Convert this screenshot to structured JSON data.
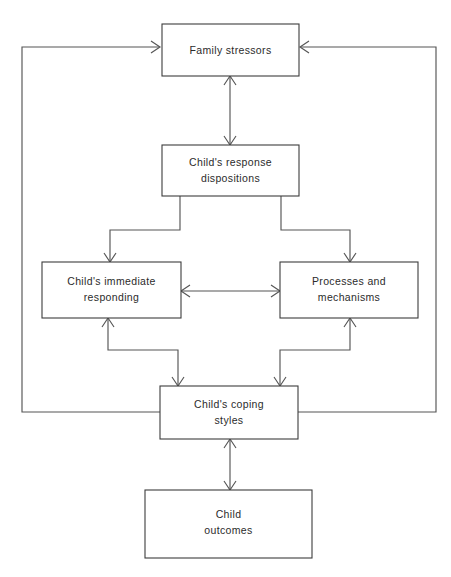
{
  "diagram": {
    "background_color": "#ffffff",
    "line_color": "#555555",
    "box_border_color": "#3c3c3c",
    "text_color": "#2b2b2b",
    "nodes": [
      {
        "id": "family-stressors",
        "line1": "Family stressors",
        "line2": ""
      },
      {
        "id": "response-dispositions",
        "line1": "Child's response",
        "line2": "dispositions"
      },
      {
        "id": "immediate-responding",
        "line1": "Child's immediate",
        "line2": "responding"
      },
      {
        "id": "processes-mechanisms",
        "line1": "Processes and",
        "line2": "mechanisms"
      },
      {
        "id": "coping-styles",
        "line1": "Child's coping",
        "line2": "styles"
      },
      {
        "id": "child-outcomes",
        "line1": "Child",
        "line2": "outcomes"
      }
    ],
    "edges": [
      {
        "id": "stressors-dispositions",
        "from": "family-stressors",
        "to": "response-dispositions",
        "direction": "bidirectional"
      },
      {
        "id": "dispositions-immediate",
        "from": "response-dispositions",
        "to": "immediate-responding",
        "direction": "forward"
      },
      {
        "id": "dispositions-processes",
        "from": "response-dispositions",
        "to": "processes-mechanisms",
        "direction": "forward"
      },
      {
        "id": "immediate-processes",
        "from": "immediate-responding",
        "to": "processes-mechanisms",
        "direction": "bidirectional"
      },
      {
        "id": "immediate-coping",
        "from": "immediate-responding",
        "to": "coping-styles",
        "direction": "bidirectional"
      },
      {
        "id": "processes-coping",
        "from": "processes-mechanisms",
        "to": "coping-styles",
        "direction": "bidirectional"
      },
      {
        "id": "coping-outcomes",
        "from": "coping-styles",
        "to": "child-outcomes",
        "direction": "bidirectional"
      },
      {
        "id": "coping-stressors-left",
        "from": "coping-styles",
        "to": "family-stressors",
        "direction": "forward"
      },
      {
        "id": "coping-stressors-right",
        "from": "coping-styles",
        "to": "family-stressors",
        "direction": "forward"
      }
    ]
  }
}
